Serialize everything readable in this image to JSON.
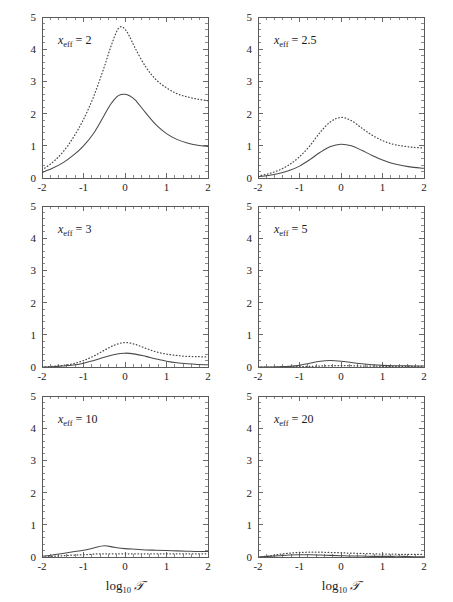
{
  "figure": {
    "width": 453,
    "height": 602,
    "background": "#ffffff",
    "ink_color": "#4a4a4a"
  },
  "chart_data": {
    "type": "line",
    "title": "",
    "subtitle": "",
    "layout": "2 columns x 3 rows of small-multiple panels",
    "shared_xlabel": "log₁₀ 𝒯",
    "shared_ylabel": "",
    "xlim": [
      -2,
      2
    ],
    "ylim": [
      0,
      5
    ],
    "xticks": [
      -2,
      -1,
      0,
      1,
      2
    ],
    "xticklabels": [
      "-2",
      "-1",
      "0",
      "1",
      "2"
    ],
    "yticks": [
      0,
      1,
      2,
      3,
      4,
      5
    ],
    "yticklabels": [
      "0",
      "1",
      "2",
      "3",
      "4",
      "5"
    ],
    "minor_ticks_per_interval": {
      "x": 4,
      "y": 4
    },
    "grid": false,
    "legend": "none",
    "series_styles": [
      {
        "name": "solid",
        "linestyle": "solid"
      },
      {
        "name": "dotted",
        "linestyle": "dotted"
      }
    ],
    "panels": [
      {
        "id": "panel-xeff-2",
        "label": "x_eff = 2",
        "label_base": "x",
        "label_sub": "eff",
        "label_value": "= 2",
        "row": 0,
        "col": 0,
        "x": [
          -2.0,
          -1.75,
          -1.5,
          -1.25,
          -1.0,
          -0.75,
          -0.5,
          -0.35,
          -0.2,
          -0.1,
          0.0,
          0.1,
          0.25,
          0.5,
          0.75,
          1.0,
          1.25,
          1.5,
          1.75,
          2.0
        ],
        "series": [
          {
            "name": "solid",
            "values": [
              0.17,
              0.3,
              0.47,
              0.7,
              1.0,
              1.4,
              1.95,
              2.28,
              2.52,
              2.59,
              2.6,
              2.56,
              2.42,
              2.02,
              1.65,
              1.38,
              1.2,
              1.09,
              1.02,
              0.98
            ]
          },
          {
            "name": "dotted",
            "values": [
              0.25,
              0.48,
              0.8,
              1.25,
              1.82,
              2.55,
              3.45,
              4.05,
              4.55,
              4.7,
              4.62,
              4.42,
              4.02,
              3.45,
              3.05,
              2.8,
              2.62,
              2.52,
              2.45,
              2.4
            ]
          }
        ]
      },
      {
        "id": "panel-xeff-2p5",
        "label": "x_eff = 2.5",
        "label_base": "x",
        "label_sub": "eff",
        "label_value": "= 2.5",
        "row": 0,
        "col": 1,
        "x": [
          -2.0,
          -1.75,
          -1.5,
          -1.25,
          -1.0,
          -0.75,
          -0.5,
          -0.25,
          0.0,
          0.25,
          0.5,
          0.75,
          1.0,
          1.25,
          1.5,
          1.75,
          2.0
        ],
        "series": [
          {
            "name": "solid",
            "values": [
              0.04,
              0.08,
              0.14,
              0.23,
              0.37,
              0.57,
              0.8,
              0.98,
              1.05,
              1.0,
              0.86,
              0.7,
              0.56,
              0.45,
              0.38,
              0.33,
              0.3
            ]
          },
          {
            "name": "dotted",
            "values": [
              0.06,
              0.13,
              0.24,
              0.41,
              0.66,
              1.0,
              1.42,
              1.75,
              1.88,
              1.78,
              1.55,
              1.33,
              1.16,
              1.05,
              0.99,
              0.95,
              0.93
            ]
          }
        ]
      },
      {
        "id": "panel-xeff-3",
        "label": "x_eff = 3",
        "label_base": "x",
        "label_sub": "eff",
        "label_value": "= 3",
        "row": 1,
        "col": 0,
        "x": [
          -2.0,
          -1.75,
          -1.5,
          -1.25,
          -1.0,
          -0.75,
          -0.5,
          -0.25,
          0.0,
          0.25,
          0.5,
          0.75,
          1.0,
          1.25,
          1.5,
          1.75,
          2.0
        ],
        "series": [
          {
            "name": "solid",
            "values": [
              0.0,
              0.01,
              0.03,
              0.06,
              0.12,
              0.2,
              0.3,
              0.39,
              0.43,
              0.4,
              0.33,
              0.25,
              0.18,
              0.13,
              0.1,
              0.08,
              0.07
            ]
          },
          {
            "name": "dotted",
            "values": [
              0.0,
              0.02,
              0.05,
              0.1,
              0.2,
              0.34,
              0.52,
              0.68,
              0.76,
              0.7,
              0.58,
              0.47,
              0.4,
              0.36,
              0.33,
              0.32,
              0.31
            ]
          }
        ]
      },
      {
        "id": "panel-xeff-5",
        "label": "x_eff = 5",
        "label_base": "x",
        "label_sub": "eff",
        "label_value": "= 5",
        "row": 1,
        "col": 1,
        "x": [
          -2.0,
          -1.75,
          -1.5,
          -1.25,
          -1.0,
          -0.75,
          -0.5,
          -0.25,
          0.0,
          0.25,
          0.5,
          0.75,
          1.0,
          1.25,
          1.5,
          1.75,
          2.0
        ],
        "series": [
          {
            "name": "solid",
            "values": [
              0.0,
              0.0,
              0.01,
              0.02,
              0.05,
              0.12,
              0.18,
              0.2,
              0.18,
              0.14,
              0.1,
              0.07,
              0.05,
              0.04,
              0.04,
              0.03,
              0.03
            ]
          },
          {
            "name": "dotted",
            "values": [
              0.0,
              0.0,
              0.0,
              0.01,
              0.01,
              0.02,
              0.03,
              0.04,
              0.04,
              0.04,
              0.03,
              0.03,
              0.02,
              0.02,
              0.02,
              0.02,
              0.02
            ]
          }
        ]
      },
      {
        "id": "panel-xeff-10",
        "label": "x_eff = 10",
        "label_base": "x",
        "label_sub": "eff",
        "label_value": "= 10",
        "row": 2,
        "col": 0,
        "x": [
          -2.0,
          -1.75,
          -1.5,
          -1.25,
          -1.0,
          -0.75,
          -0.5,
          -0.25,
          0.0,
          0.25,
          0.5,
          0.75,
          1.0,
          1.25,
          1.5,
          1.75,
          2.0
        ],
        "series": [
          {
            "name": "solid",
            "values": [
              0.02,
              0.06,
              0.11,
              0.16,
              0.21,
              0.28,
              0.35,
              0.3,
              0.26,
              0.24,
              0.22,
              0.21,
              0.2,
              0.19,
              0.18,
              0.17,
              0.17
            ]
          },
          {
            "name": "dotted",
            "values": [
              0.0,
              0.02,
              0.04,
              0.06,
              0.07,
              0.09,
              0.1,
              0.1,
              0.1,
              0.1,
              0.1,
              0.1,
              0.1,
              0.1,
              0.1,
              0.1,
              0.1
            ]
          }
        ]
      },
      {
        "id": "panel-xeff-20",
        "label": "x_eff = 20",
        "label_base": "x",
        "label_sub": "eff",
        "label_value": "= 20",
        "row": 2,
        "col": 1,
        "x": [
          -2.0,
          -1.75,
          -1.5,
          -1.25,
          -1.0,
          -0.75,
          -0.5,
          -0.25,
          0.0,
          0.25,
          0.5,
          0.75,
          1.0,
          1.25,
          1.5,
          1.75,
          2.0
        ],
        "series": [
          {
            "name": "solid",
            "values": [
              0.0,
              0.02,
              0.04,
              0.06,
              0.07,
              0.07,
              0.06,
              0.05,
              0.04,
              0.03,
              0.03,
              0.02,
              0.02,
              0.02,
              0.02,
              0.01,
              0.01
            ]
          },
          {
            "name": "dotted",
            "values": [
              0.0,
              0.03,
              0.08,
              0.12,
              0.14,
              0.15,
              0.15,
              0.14,
              0.13,
              0.12,
              0.11,
              0.1,
              0.09,
              0.09,
              0.08,
              0.08,
              0.08
            ]
          }
        ]
      }
    ]
  },
  "axis_label": {
    "prefix": "log",
    "subscript": "10",
    "symbol": "𝒯"
  }
}
